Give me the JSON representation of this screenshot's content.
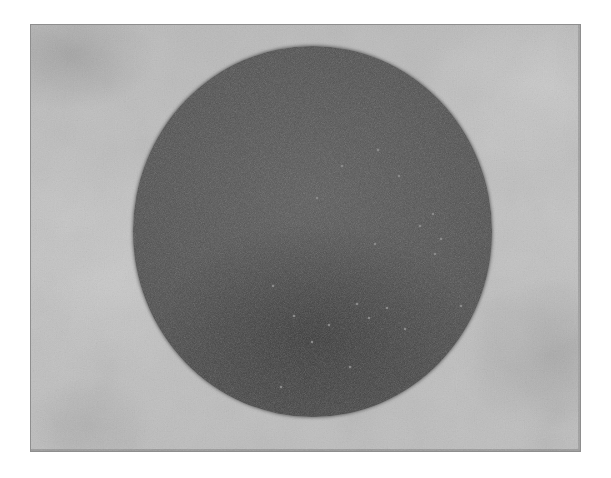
{
  "image": {
    "description": "Grayscale photograph of a dark circular disc on a light gray mottled surface",
    "background_color": "#bfbfbf",
    "frame_border_color": "#8e8e8e",
    "page_background": "#ffffff"
  },
  "disc": {
    "shape": "circle",
    "color": "#535353",
    "speckle_color": "#8a8a8a",
    "speckles": [
      {
        "x": 184,
        "y": 152
      },
      {
        "x": 209,
        "y": 120
      },
      {
        "x": 245,
        "y": 104
      },
      {
        "x": 266,
        "y": 130
      },
      {
        "x": 300,
        "y": 168
      },
      {
        "x": 287,
        "y": 180
      },
      {
        "x": 308,
        "y": 193
      },
      {
        "x": 242,
        "y": 198
      },
      {
        "x": 224,
        "y": 258
      },
      {
        "x": 196,
        "y": 279
      },
      {
        "x": 254,
        "y": 262
      },
      {
        "x": 272,
        "y": 283
      },
      {
        "x": 236,
        "y": 272
      },
      {
        "x": 217,
        "y": 321
      },
      {
        "x": 161,
        "y": 270
      },
      {
        "x": 179,
        "y": 296
      },
      {
        "x": 328,
        "y": 260
      },
      {
        "x": 140,
        "y": 240
      },
      {
        "x": 302,
        "y": 208
      },
      {
        "x": 148,
        "y": 341
      },
      {
        "x": 268,
        "y": 348
      }
    ]
  }
}
